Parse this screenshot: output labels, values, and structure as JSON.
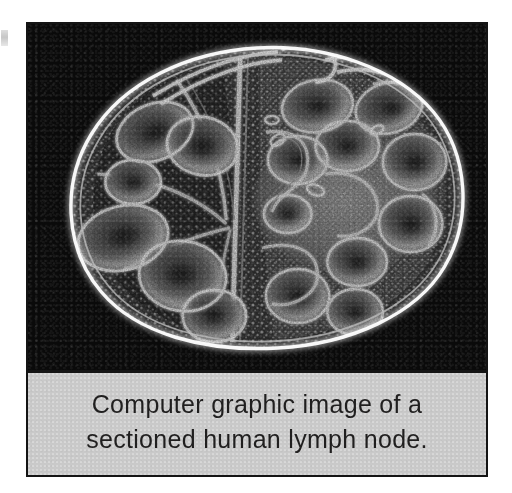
{
  "page": {
    "background_color": "#ffffff",
    "width": 512,
    "height": 493
  },
  "figure": {
    "frame_border_color": "#141414",
    "plate_background_color": "#0a0a0a",
    "subject": "sectioned human lymph node",
    "rendering_style": "grayscale computer graphic / false-colour micrograph",
    "image_alt": "Oval sectioned lymph node rendered in greyscale, showing a bright outer capsule, lobulated cortical follicles with dark germinal centres, trabeculae radiating inward, and a central hilum region."
  },
  "caption": {
    "background_color": "#c9c9c9",
    "text_color": "#201f1f",
    "line1": "Computer graphic image of a",
    "line2": "sectioned human lymph node.",
    "full_text": "Computer graphic image of a sectioned human lymph node."
  },
  "artifacts": {
    "left_margin_speck": "scan-artifact-speck"
  }
}
